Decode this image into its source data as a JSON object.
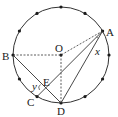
{
  "diagram": {
    "circle": {
      "cx": 61,
      "cy": 55,
      "r": 48,
      "division_points": 12
    },
    "labels": {
      "O": "O",
      "A": "A",
      "B": "B",
      "C": "C",
      "D": "D",
      "E": "E",
      "x": "x",
      "y": "y"
    },
    "segments": [
      {
        "from": "A",
        "to": "O",
        "style": "dashed"
      },
      {
        "from": "B",
        "to": "O",
        "style": "dashed"
      },
      {
        "from": "O",
        "to": "D",
        "style": "dashed"
      },
      {
        "from": "A",
        "to": "C",
        "style": "solid"
      },
      {
        "from": "A",
        "to": "D",
        "style": "solid"
      },
      {
        "from": "B",
        "to": "D",
        "style": "solid"
      }
    ],
    "angles": [
      {
        "name": "x",
        "vertex": "A",
        "between": [
          "C",
          "D"
        ]
      },
      {
        "name": "y",
        "vertex": "E",
        "between": [
          "C",
          "B"
        ]
      }
    ],
    "colors": {
      "stroke": "#333333",
      "point": "#1a1a1a"
    }
  }
}
